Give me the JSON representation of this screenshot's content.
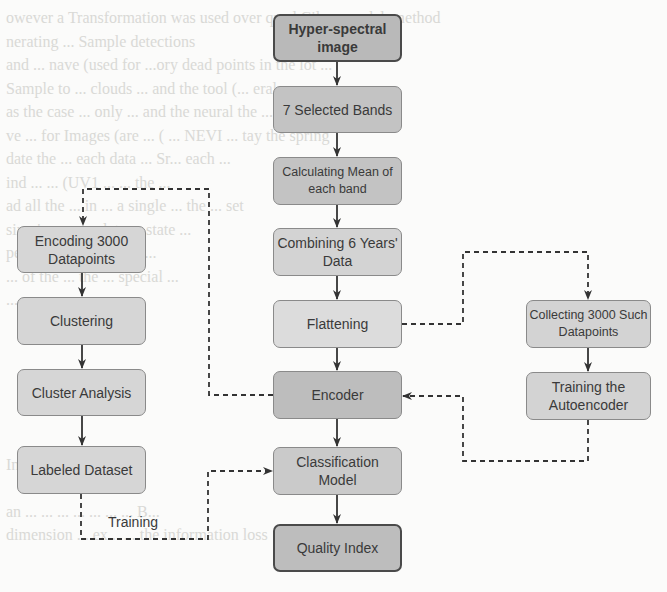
{
  "background_text": {
    "lines": [
      "owever a Transformation was used over quad Cilver model. method",
      "nerating ... Sample detections",
      "and ... nave (used for ...ory dead points in the lot ...",
      "Sample to ... clouds ... and the tool (... eral",
      "as the case ... only ... and the neural the ... of",
      "ve ... for Images (are ... ( ... NEVI ... tay the spring",
      "date the ... each data ... Sr... each ... ",
      "ind ... ... (UV1 ... ... the ...",
      "ad all the ... in ... a single ... the ... set",
      "sing is ... complete ... state ...",
      "pe... ... high ... to ... w...",
      "... of the ... the ... special ...",
      "...",
      "",
      "",
      "",
      "",
      "",
      "",
      "Incentive",
      "",
      "an ... ... ... ... ... ... ... B...",
      "dimension ... ex... ... the information loss"
    ]
  },
  "colors": {
    "box_fill_dark": "#b7b7b7",
    "box_fill_mid": "#c6c6c6",
    "box_fill_light": "#d5d5d5",
    "box_fill_lightest": "#dedede",
    "border_dark": "#4a4a4a",
    "border_normal": "#8a8a8a",
    "arrow": "#333333",
    "text": "#3a3a3a"
  },
  "nodes": {
    "hyperspectral": {
      "label": "Hyper-spectral image"
    },
    "selected_bands": {
      "label": "7 Selected Bands"
    },
    "mean_band": {
      "label": "Calculating Mean of each band"
    },
    "combining": {
      "label": "Combining 6 Years' Data"
    },
    "flattening": {
      "label": "Flattening"
    },
    "encoder": {
      "label": "Encoder"
    },
    "classification": {
      "label": "Classification Model"
    },
    "quality_index": {
      "label": "Quality Index"
    },
    "encoding_3000": {
      "label": "Encoding 3000 Datapoints"
    },
    "clustering": {
      "label": "Clustering"
    },
    "cluster_analysis": {
      "label": "Cluster Analysis"
    },
    "labeled_dataset": {
      "label": "Labeled Dataset"
    },
    "collecting_3000": {
      "label": "Collecting 3000 Such Datapoints"
    },
    "training_autoencoder": {
      "label": "Training the Autoencoder"
    }
  },
  "edges": [
    {
      "from": "hyperspectral",
      "to": "selected_bands",
      "style": "solid"
    },
    {
      "from": "selected_bands",
      "to": "mean_band",
      "style": "solid"
    },
    {
      "from": "mean_band",
      "to": "combining",
      "style": "solid"
    },
    {
      "from": "combining",
      "to": "flattening",
      "style": "solid"
    },
    {
      "from": "flattening",
      "to": "encoder",
      "style": "solid"
    },
    {
      "from": "encoder",
      "to": "classification",
      "style": "solid"
    },
    {
      "from": "classification",
      "to": "quality_index",
      "style": "solid"
    },
    {
      "from": "encoding_3000",
      "to": "clustering",
      "style": "solid"
    },
    {
      "from": "clustering",
      "to": "cluster_analysis",
      "style": "solid"
    },
    {
      "from": "cluster_analysis",
      "to": "labeled_dataset",
      "style": "solid"
    },
    {
      "from": "collecting_3000",
      "to": "training_autoencoder",
      "style": "solid"
    },
    {
      "from": "encoder",
      "to": "encoding_3000",
      "style": "dashed"
    },
    {
      "from": "flattening",
      "to": "collecting_3000",
      "style": "dashed"
    },
    {
      "from": "training_autoencoder",
      "to": "encoder",
      "style": "dashed"
    },
    {
      "from": "labeled_dataset",
      "to": "classification",
      "style": "dashed",
      "label": "Training"
    }
  ],
  "edge_labels": {
    "training": "Training"
  }
}
